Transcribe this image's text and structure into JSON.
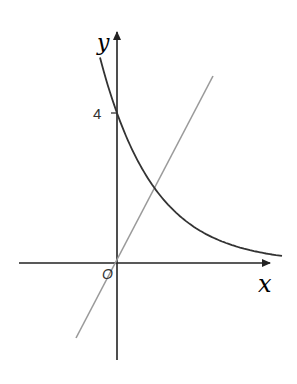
{
  "figure": {
    "x_axis_label": "x",
    "y_axis_label": "y",
    "origin_label": "O",
    "y_tick_label": "4"
  },
  "colors": {
    "axes": "#222222",
    "curve": "#333333",
    "line": "#9a9a9a"
  },
  "curves": [
    {
      "name": "exponential-curve",
      "expression": "y = 4·(1/2)^x",
      "y_intercept": 4
    },
    {
      "name": "straight-line",
      "expression": "y = 2x",
      "passes_through_origin": true
    }
  ],
  "intersection": {
    "x": 1,
    "y": 2
  }
}
